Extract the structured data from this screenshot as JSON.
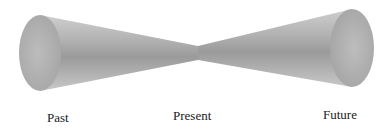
{
  "diagram": {
    "type": "time-cone",
    "labels": {
      "past": "Past",
      "present": "Present",
      "future": "Future"
    },
    "colors": {
      "background": "#ffffff",
      "cone_light": "#c9c9c9",
      "cone_mid": "#a9a9a9",
      "cone_dark": "#8e8e8e",
      "end_cap": "#b5b5b5",
      "text": "#1a1a1a"
    }
  }
}
